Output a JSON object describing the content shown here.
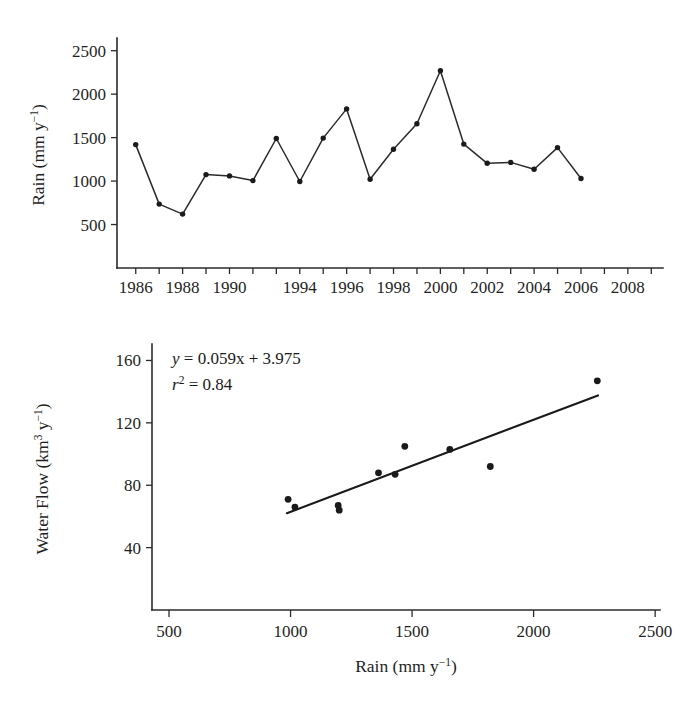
{
  "figure": {
    "name": "rain-and-water-flow-figure",
    "panel_count": 2
  },
  "chart_data": [
    {
      "id": "rain-timeseries",
      "type": "line",
      "title": "",
      "xlabel": "",
      "ylabel": "Rain (mm y−1)",
      "ylabel_parts": {
        "text": "Rain (mm y",
        "sup": "−1",
        "tail": ")"
      },
      "x": [
        1986,
        1987,
        1988,
        1989,
        1990,
        1991,
        1992,
        1993,
        1994,
        1995,
        1996,
        1997,
        1998,
        1999,
        2000,
        2001,
        2002,
        2003,
        2004,
        2005,
        2006,
        2007,
        2008
      ],
      "values": [
        1420,
        735,
        620,
        1075,
        1060,
        1005,
        1490,
        995,
        1495,
        1830,
        1020,
        1365,
        1660,
        2270,
        1425,
        1205,
        1215,
        1135,
        1385,
        1030,
        null,
        null,
        null
      ],
      "series_x": [
        1986,
        1987,
        1988,
        1989,
        1990,
        1991,
        1992,
        1993,
        1994,
        1995,
        1996,
        1997,
        1998,
        1999,
        2000,
        2001,
        2002,
        2003,
        2004,
        2005
      ],
      "series_values": [
        1420,
        735,
        620,
        1075,
        1060,
        1005,
        1490,
        995,
        1495,
        1830,
        1020,
        1365,
        1660,
        2270,
        1425,
        1205,
        1215,
        1135,
        1385,
        1030
      ],
      "xlim": [
        1985.2,
        2008.5
      ],
      "ylim": [
        0,
        2600
      ],
      "ytick_values": [
        500,
        1000,
        1500,
        2000,
        2500
      ],
      "ytick_labels": [
        "500",
        "1000",
        "1500",
        "2000",
        "2500"
      ],
      "xtick_values": [
        1986,
        1987,
        1988,
        1989,
        1990,
        1991,
        1992,
        1993,
        1994,
        1995,
        1996,
        1997,
        1998,
        1999,
        2000,
        2001,
        2002,
        2003,
        2004,
        2005,
        2006,
        2007,
        2008
      ],
      "xtick_labeled": [
        {
          "value": 1986,
          "label": "1986"
        },
        {
          "value": 1988,
          "label": "1988"
        },
        {
          "value": 1990,
          "label": "1990"
        },
        {
          "value": 1993,
          "label": "1994"
        },
        {
          "value": 1995,
          "label": "1996"
        },
        {
          "value": 1997,
          "label": "1998"
        },
        {
          "value": 1999,
          "label": "2000"
        },
        {
          "value": 2001,
          "label": "2002"
        },
        {
          "value": 2003,
          "label": "2004"
        },
        {
          "value": 2005,
          "label": "2006"
        },
        {
          "value": 2007,
          "label": "2008"
        }
      ],
      "grid": false,
      "legend": false,
      "marker": "filled-circle",
      "line_color": "#2b2b2b"
    },
    {
      "id": "rain-vs-waterflow-scatter",
      "type": "scatter",
      "title": "",
      "xlabel": "Rain (mm y−1)",
      "xlabel_parts": {
        "text": "Rain (mm y",
        "sup": "−1",
        "tail": ")"
      },
      "ylabel": "Water Flow (km3 y−1)",
      "ylabel_parts": {
        "text": "Water Flow (km",
        "sup1": "3",
        "mid": " y",
        "sup2": "−1",
        "tail": ")"
      },
      "points": [
        {
          "x": 990,
          "y": 71
        },
        {
          "x": 1018,
          "y": 66
        },
        {
          "x": 1196,
          "y": 67
        },
        {
          "x": 1200,
          "y": 64
        },
        {
          "x": 1362,
          "y": 88
        },
        {
          "x": 1430,
          "y": 87
        },
        {
          "x": 1470,
          "y": 105
        },
        {
          "x": 1655,
          "y": 103
        },
        {
          "x": 1822,
          "y": 92
        },
        {
          "x": 2262,
          "y": 147
        }
      ],
      "xlim": [
        430,
        2520
      ],
      "ylim": [
        0,
        168
      ],
      "xtick_values": [
        500,
        1000,
        1500,
        2000,
        2500
      ],
      "xtick_labels": [
        "500",
        "1000",
        "1500",
        "2000",
        "2500"
      ],
      "ytick_values": [
        40,
        80,
        120,
        160
      ],
      "ytick_labels": [
        "40",
        "80",
        "120",
        "160"
      ],
      "fit": {
        "slope": 0.059,
        "intercept": 3.975,
        "r_squared": 0.84,
        "x_start": 985,
        "x_end": 2265
      },
      "annotations": {
        "equation": {
          "lhs": "y",
          "body": " = 0.059x + 3.975"
        },
        "r2": {
          "lhs": "r",
          "sup": "2",
          "body": " = 0.84"
        }
      },
      "grid": false,
      "legend": false,
      "marker": "filled-circle",
      "point_color": "#1a1a1a",
      "line_color": "#1a1a1a"
    }
  ]
}
